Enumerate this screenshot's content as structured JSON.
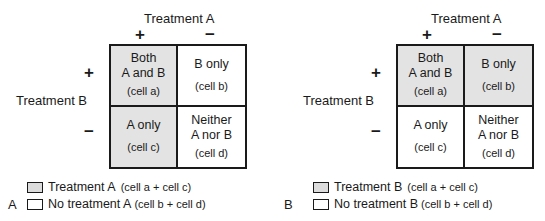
{
  "colors": {
    "shaded": "#e3e3e3",
    "unshaded": "#ffffff",
    "border": "#1a1a1a"
  },
  "panels": [
    {
      "letter": "A",
      "column_axis": {
        "title": "Treatment A",
        "plus": "+",
        "minus": "−"
      },
      "row_axis": {
        "title": "Treatment B",
        "plus": "+",
        "minus": "−"
      },
      "cells": [
        {
          "line1": "Both",
          "line2": "A and B",
          "sub": "(cell a)",
          "shaded": true
        },
        {
          "line1": "B only",
          "line2": "",
          "sub": "(cell b)",
          "shaded": false
        },
        {
          "line1": "A only",
          "line2": "",
          "sub": "(cell c)",
          "shaded": true
        },
        {
          "line1": "Neither",
          "line2": "A nor B",
          "sub": "(cell d)",
          "shaded": false
        }
      ],
      "legend": [
        {
          "label": "Treatment A",
          "note": "(cell a + cell c)",
          "shaded": true
        },
        {
          "label": "No treatment A",
          "note": "(cell b + cell d)",
          "shaded": false
        }
      ]
    },
    {
      "letter": "B",
      "column_axis": {
        "title": "Treatment A",
        "plus": "+",
        "minus": "−"
      },
      "row_axis": {
        "title": "Treatment B",
        "plus": "+",
        "minus": "−"
      },
      "cells": [
        {
          "line1": "Both",
          "line2": "A and B",
          "sub": "(cell a)",
          "shaded": true
        },
        {
          "line1": "B only",
          "line2": "",
          "sub": "(cell b)",
          "shaded": true
        },
        {
          "line1": "A only",
          "line2": "",
          "sub": "(cell c)",
          "shaded": false
        },
        {
          "line1": "Neither",
          "line2": "A nor B",
          "sub": "(cell d)",
          "shaded": false
        }
      ],
      "legend": [
        {
          "label": "Treatment B",
          "note": "(cell a + cell c)",
          "shaded": true
        },
        {
          "label": "No treatment B",
          "note": "(cell b + cell d)",
          "shaded": false
        }
      ]
    }
  ]
}
